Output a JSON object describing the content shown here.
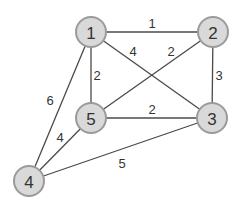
{
  "graph": {
    "type": "weighted-undirected-graph",
    "colors": {
      "node_fill": "#d9d9d9",
      "node_stroke": "#9a9a9a",
      "edge": "#4a4a4a",
      "text": "#333333"
    },
    "nodes": [
      {
        "id": "1",
        "label": "1",
        "x": 91,
        "y": 32
      },
      {
        "id": "2",
        "label": "2",
        "x": 213,
        "y": 32
      },
      {
        "id": "3",
        "label": "3",
        "x": 212,
        "y": 118
      },
      {
        "id": "4",
        "label": "4",
        "x": 29,
        "y": 181
      },
      {
        "id": "5",
        "label": "5",
        "x": 91,
        "y": 118
      }
    ],
    "edges": [
      {
        "from": "1",
        "to": "2",
        "weight": "1",
        "lx": 152,
        "ly": 23
      },
      {
        "from": "1",
        "to": "3",
        "weight": "4",
        "lx": 133,
        "ly": 51
      },
      {
        "from": "5",
        "to": "2",
        "weight": "2",
        "lx": 171,
        "ly": 51
      },
      {
        "from": "1",
        "to": "5",
        "weight": "2",
        "lx": 97,
        "ly": 75
      },
      {
        "from": "2",
        "to": "3",
        "weight": "3",
        "lx": 219,
        "ly": 75
      },
      {
        "from": "1",
        "to": "4",
        "weight": "6",
        "lx": 50,
        "ly": 100
      },
      {
        "from": "5",
        "to": "3",
        "weight": "2",
        "lx": 152,
        "ly": 109
      },
      {
        "from": "5",
        "to": "4",
        "weight": "4",
        "lx": 60,
        "ly": 137
      },
      {
        "from": "4",
        "to": "3",
        "weight": "5",
        "lx": 122,
        "ly": 163
      }
    ]
  }
}
